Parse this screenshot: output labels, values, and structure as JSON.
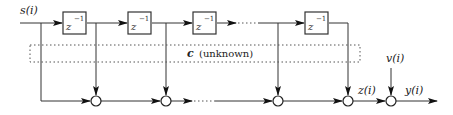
{
  "diagram": {
    "type": "tapped-delay-line FIR channel block diagram",
    "input_label": "s(i)",
    "delay_label_base": "z",
    "delay_label_exp": "−1",
    "delays": [
      {
        "id": "delay-1",
        "label": "z^-1"
      },
      {
        "id": "delay-2",
        "label": "z^-1"
      },
      {
        "id": "delay-3",
        "label": "z^-1"
      },
      {
        "id": "delay-4",
        "label": "z^-1"
      }
    ],
    "coefficients_box": {
      "symbol": "c",
      "text": "(unknown)"
    },
    "summers_count": 5,
    "intermediate_label": "z(i)",
    "noise_label": "v(i)",
    "output_label": "y(i)",
    "colors": {
      "line": "#333333",
      "arrowhead": "#111111",
      "background": "#ffffff"
    }
  }
}
